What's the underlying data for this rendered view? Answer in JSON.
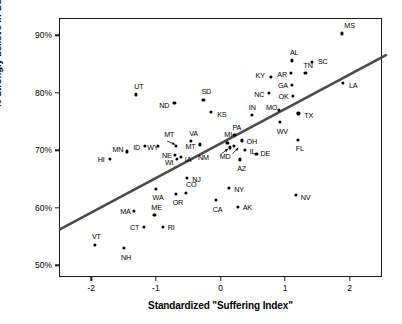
{
  "chart_data": {
    "type": "scatter",
    "title": "",
    "xlabel": "Standardized \"Suffering Index\"",
    "ylabel": "% Strongly believe in God",
    "xlim": [
      -2.5,
      2.5
    ],
    "ylim": [
      48.0,
      93.0
    ],
    "grid": false,
    "legend": "none",
    "xticks": [
      -2,
      -1,
      0,
      1,
      2
    ],
    "xtick_labels": [
      "-2",
      "-1",
      "0",
      "1",
      "2"
    ],
    "yticks": [
      50,
      60,
      70,
      80,
      90
    ],
    "ytick_labels": [
      "50%",
      "60%",
      "70%",
      "80%",
      "90%"
    ],
    "point_label_key": "state",
    "trendline": {
      "type": "line",
      "x": [
        -2.51,
        2.56
      ],
      "y": [
        56.4,
        86.8
      ],
      "color": "#4a4a4a",
      "width": 2.6
    },
    "points": [
      {
        "state": "MS",
        "x": 1.87,
        "y": 90.5,
        "lx": 2,
        "ly": -8
      },
      {
        "state": "AL",
        "x": 1.09,
        "y": 85.8,
        "lx": -2,
        "ly": -8
      },
      {
        "state": "SC",
        "x": 1.4,
        "y": 85.5,
        "lx": 6,
        "ly": -1
      },
      {
        "state": "AR",
        "x": 1.08,
        "y": 83.6,
        "lx": -14,
        "ly": 1
      },
      {
        "state": "TN",
        "x": 1.3,
        "y": 83.6,
        "lx": -2,
        "ly": -8
      },
      {
        "state": "KY",
        "x": 0.76,
        "y": 83.0,
        "lx": -15,
        "ly": -1
      },
      {
        "state": "GA",
        "x": 1.09,
        "y": 81.6,
        "lx": -14,
        "ly": 1
      },
      {
        "state": "LA",
        "x": 1.88,
        "y": 81.9,
        "lx": 6,
        "ly": 3
      },
      {
        "state": "NC",
        "x": 0.74,
        "y": 80.1,
        "lx": -15,
        "ly": 1
      },
      {
        "state": "OK",
        "x": 1.1,
        "y": 79.6,
        "lx": -14,
        "ly": 0
      },
      {
        "state": "SD",
        "x": -0.28,
        "y": 79.0,
        "lx": -2,
        "ly": -8
      },
      {
        "state": "UT",
        "x": -1.32,
        "y": 79.9,
        "lx": -2,
        "ly": -8
      },
      {
        "state": "ND",
        "x": -0.73,
        "y": 78.4,
        "lx": -15,
        "ly": 2
      },
      {
        "state": "MO",
        "x": 0.89,
        "y": 77.2,
        "lx": -13,
        "ly": -2
      },
      {
        "state": "KS",
        "x": -0.16,
        "y": 76.8,
        "lx": 6,
        "ly": 2
      },
      {
        "state": "TX",
        "x": 1.19,
        "y": 76.6,
        "lx": 6,
        "ly": 2
      },
      {
        "state": "IN",
        "x": 0.47,
        "y": 76.3,
        "lx": -3,
        "ly": -8
      },
      {
        "state": "WV",
        "x": 0.9,
        "y": 75.1,
        "lx": -3,
        "ly": 9
      },
      {
        "state": "PA",
        "x": 0.2,
        "y": 72.8,
        "lx": -2,
        "ly": -8
      },
      {
        "state": "VA",
        "x": -0.47,
        "y": 71.8,
        "lx": -2,
        "ly": -8
      },
      {
        "state": "OH",
        "x": 0.31,
        "y": 71.9,
        "lx": 5,
        "ly": 1
      },
      {
        "state": "MI",
        "x": 0.09,
        "y": 71.5,
        "lx": -3,
        "ly": -8
      },
      {
        "state": "FL",
        "x": 1.18,
        "y": 72.0,
        "lx": -2,
        "ly": 9
      },
      {
        "state": "MT",
        "x": -0.7,
        "y": 70.9,
        "lx": -12,
        "ly": -12
      },
      {
        "state": "MT2",
        "x": -0.34,
        "y": 71.2,
        "lx": -14,
        "ly": 2
      },
      {
        "state": "ID",
        "x": -1.18,
        "y": 70.9,
        "lx": -12,
        "ly": 1
      },
      {
        "state": "WY",
        "x": -0.98,
        "y": 70.9,
        "lx": -11,
        "ly": 1
      },
      {
        "state": "MN",
        "x": -1.47,
        "y": 70.0,
        "lx": -14,
        "ly": -2
      },
      {
        "state": "IL",
        "x": 0.36,
        "y": 70.3,
        "lx": 5,
        "ly": 2
      },
      {
        "state": "DE",
        "x": 0.54,
        "y": 69.6,
        "lx": 4,
        "ly": 0
      },
      {
        "state": "NE",
        "x": -0.72,
        "y": 69.4,
        "lx": -13,
        "ly": 1
      },
      {
        "state": "IA",
        "x": -0.63,
        "y": 69.0,
        "lx": 4,
        "ly": 2
      },
      {
        "state": "WI",
        "x": -0.69,
        "y": 68.7,
        "lx": -12,
        "ly": 4
      },
      {
        "state": "HI",
        "x": -1.73,
        "y": 68.7,
        "lx": -12,
        "ly": 1
      },
      {
        "state": "AZ",
        "x": 0.29,
        "y": 68.6,
        "lx": -3,
        "ly": 9
      },
      {
        "state": "MD",
        "x": 0.19,
        "y": 70.9,
        "lx": -14,
        "ly": 10
      },
      {
        "state": "NM",
        "x": 0.13,
        "y": 70.7,
        "lx": -32,
        "ly": 10
      },
      {
        "state": "NJ",
        "x": -0.53,
        "y": 65.4,
        "lx": 5,
        "ly": 2
      },
      {
        "state": "NY",
        "x": 0.12,
        "y": 63.7,
        "lx": 5,
        "ly": 2
      },
      {
        "state": "WA",
        "x": -1.02,
        "y": 63.5,
        "lx": -3,
        "ly": 9
      },
      {
        "state": "CO",
        "x": -0.55,
        "y": 62.8,
        "lx": 0,
        "ly": -8
      },
      {
        "state": "OR",
        "x": -0.71,
        "y": 62.6,
        "lx": -3,
        "ly": 9
      },
      {
        "state": "NV",
        "x": 1.15,
        "y": 62.4,
        "lx": 5,
        "ly": 2
      },
      {
        "state": "CA",
        "x": -0.09,
        "y": 61.5,
        "lx": -3,
        "ly": 9
      },
      {
        "state": "AK",
        "x": 0.25,
        "y": 60.4,
        "lx": 5,
        "ly": 1
      },
      {
        "state": "MA",
        "x": -1.35,
        "y": 59.6,
        "lx": -14,
        "ly": 0
      },
      {
        "state": "ME",
        "x": -1.04,
        "y": 58.9,
        "lx": -3,
        "ly": -8
      },
      {
        "state": "CT",
        "x": -1.2,
        "y": 56.9,
        "lx": -14,
        "ly": 1
      },
      {
        "state": "RI",
        "x": -0.91,
        "y": 56.9,
        "lx": 5,
        "ly": 1
      },
      {
        "state": "VT",
        "x": -1.96,
        "y": 53.8,
        "lx": -3,
        "ly": -8
      },
      {
        "state": "NH",
        "x": -1.51,
        "y": 53.2,
        "lx": -3,
        "ly": 9
      }
    ],
    "annotations": [
      {
        "name": "mt-leader-arrow",
        "from_x": -0.84,
        "from_y": 71.8,
        "to_x": -0.72,
        "to_y": 71.2
      },
      {
        "name": "nm-leader-arrow",
        "from_x": 0.0,
        "from_y": 69.6,
        "to_x": 0.1,
        "to_y": 70.4
      },
      {
        "name": "md-leader-arrow",
        "from_x": 0.17,
        "from_y": 69.6,
        "to_x": 0.26,
        "to_y": 70.6
      }
    ]
  },
  "colors": {
    "axis": "#1a1a1a",
    "point": "#000000",
    "trendline": "#4a4a4a",
    "background": "#ffffff"
  }
}
